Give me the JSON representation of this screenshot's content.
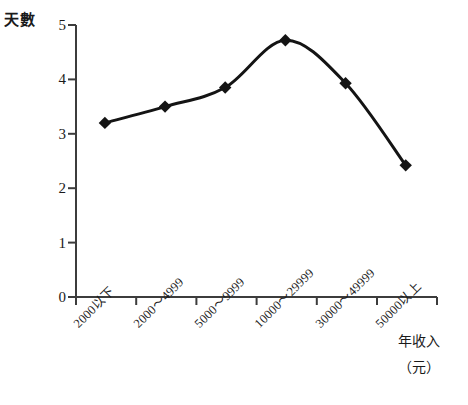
{
  "chart_data": {
    "type": "line",
    "title": "",
    "xlabel": "年收入（元）",
    "ylabel": "天數",
    "categories": [
      "2000以下",
      "2000～4999",
      "5000～9999",
      "10000～29999",
      "30000～49999",
      "50000以上"
    ],
    "values": [
      3.2,
      3.5,
      3.85,
      4.72,
      3.93,
      2.42
    ],
    "ylim": [
      0,
      5
    ],
    "yticks": [
      "0",
      "1",
      "2",
      "3",
      "4",
      "5"
    ],
    "grid": false,
    "legend": "none",
    "marker": "diamond",
    "line_color": "#141414",
    "marker_color": "#141414",
    "axis_color": "#3c3c3c",
    "background": "#ffffff"
  },
  "axis": {
    "y_title": "天數",
    "x_title_main": "年收入",
    "x_title_unit": "（元）"
  }
}
